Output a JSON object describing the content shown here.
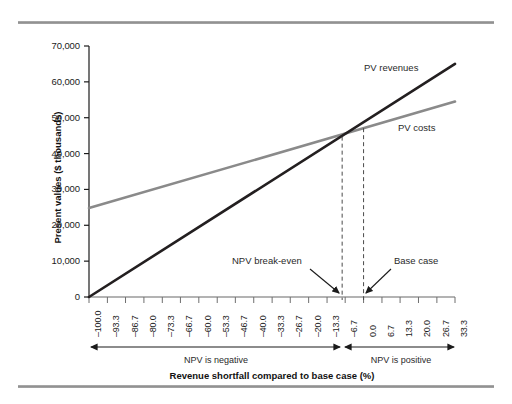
{
  "chart_data": {
    "type": "line",
    "title": "",
    "xlabel": "Revenue shortfall compared to base case (%)",
    "ylabel": "Present values ($ thousands)",
    "xlim": [
      -100.0,
      33.3
    ],
    "ylim": [
      0,
      70000
    ],
    "grid": false,
    "legend_position": "inline-annotations",
    "xticks": [
      "–100.0",
      "–93.3",
      "–86.7",
      "–80.0",
      "–73.3",
      "–66.7",
      "–60.0",
      "–53.3",
      "–46.7",
      "–40.0",
      "–33.3",
      "–26.7",
      "–20.0",
      "–13.3",
      "–6.7",
      "0.0",
      "6.7",
      "13.3",
      "20.0",
      "26.7",
      "33.3"
    ],
    "xtick_values": [
      -100.0,
      -93.3,
      -86.7,
      -80.0,
      -73.3,
      -66.7,
      -60.0,
      -53.3,
      -46.7,
      -40.0,
      -33.3,
      -26.7,
      -20.0,
      -13.3,
      -6.7,
      0.0,
      6.7,
      13.3,
      20.0,
      26.7,
      33.3
    ],
    "yticks": [
      "0",
      "10,000",
      "20,000",
      "30,000",
      "40,000",
      "50,000",
      "60,000",
      "70,000"
    ],
    "ytick_values": [
      0,
      10000,
      20000,
      30000,
      40000,
      50000,
      60000,
      70000
    ],
    "series": [
      {
        "name": "PV revenues",
        "color": "#231f20",
        "x": [
          -100.0,
          33.3
        ],
        "values": [
          0,
          65000
        ]
      },
      {
        "name": "PV costs",
        "color": "#8a8a8a",
        "x": [
          -100.0,
          33.3
        ],
        "values": [
          24800,
          54500
        ]
      }
    ],
    "annotations": [
      {
        "label": "NPV break-even",
        "x": -7.8,
        "note": "vertical dashed line at crossover of PV revenues and PV costs"
      },
      {
        "label": "Base case",
        "x": 0.0,
        "note": "vertical dashed line at zero shortfall"
      }
    ],
    "range_bands": [
      {
        "label": "NPV is negative",
        "from": -100.0,
        "to": -7.8
      },
      {
        "label": "NPV is positive",
        "from": -7.8,
        "to": 33.3
      }
    ],
    "intersection": {
      "x": -7.8,
      "y": 45000
    }
  }
}
